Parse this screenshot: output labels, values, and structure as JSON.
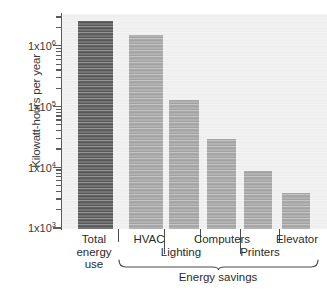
{
  "chart_data": {
    "type": "bar",
    "title": "",
    "xlabel": "",
    "ylabel": "Kilowatt-hours per year",
    "yscale": "log",
    "ylim": [
      1000,
      4000000
    ],
    "grid": false,
    "legend": null,
    "categories": [
      "Total energy use",
      "HVAC",
      "Lighting",
      "Computers",
      "Printers",
      "Elevator"
    ],
    "values": [
      2600000,
      1500000,
      130000,
      29000,
      8600,
      3800
    ],
    "bar_colors": [
      "#4a4a4a",
      "#9b9b9b",
      "#9b9b9b",
      "#9b9b9b",
      "#9b9b9b",
      "#9b9b9b"
    ],
    "ytick_labels": [
      "1x10",
      "1x10",
      "1x10",
      "1x10"
    ],
    "ytick_exponents": [
      "3",
      "4",
      "5",
      "6"
    ],
    "ytick_values": [
      1000,
      10000,
      100000,
      1000000
    ],
    "groups": [
      {
        "label": "Energy savings",
        "members": [
          "HVAC",
          "Lighting",
          "Computers",
          "Printers",
          "Elevator"
        ]
      }
    ],
    "annotations": []
  },
  "axes": {
    "y_title": "Kilowatt-hours per year",
    "ticks": [
      {
        "label_mantissa": "1x10",
        "label_exponent": "6",
        "value": 1000000
      },
      {
        "label_mantissa": "1x10",
        "label_exponent": "5",
        "value": 100000
      },
      {
        "label_mantissa": "1x10",
        "label_exponent": "4",
        "value": 10000
      },
      {
        "label_mantissa": "1x10",
        "label_exponent": "3",
        "value": 1000
      }
    ]
  },
  "x_labels": {
    "total": {
      "line1": "Total",
      "line2": "energy",
      "line3": "use"
    },
    "hvac": "HVAC",
    "lighting": "Lighting",
    "computers": "Computers",
    "printers": "Printers",
    "elevator": "Elevator"
  },
  "group": {
    "label": "Energy savings"
  },
  "colors": {
    "bar_dark": "#4a4a4a",
    "bar_light": "#9b9b9b",
    "plot_background": "#ededed",
    "axis": "#5b5b5b",
    "text": "#2b2b2b"
  }
}
